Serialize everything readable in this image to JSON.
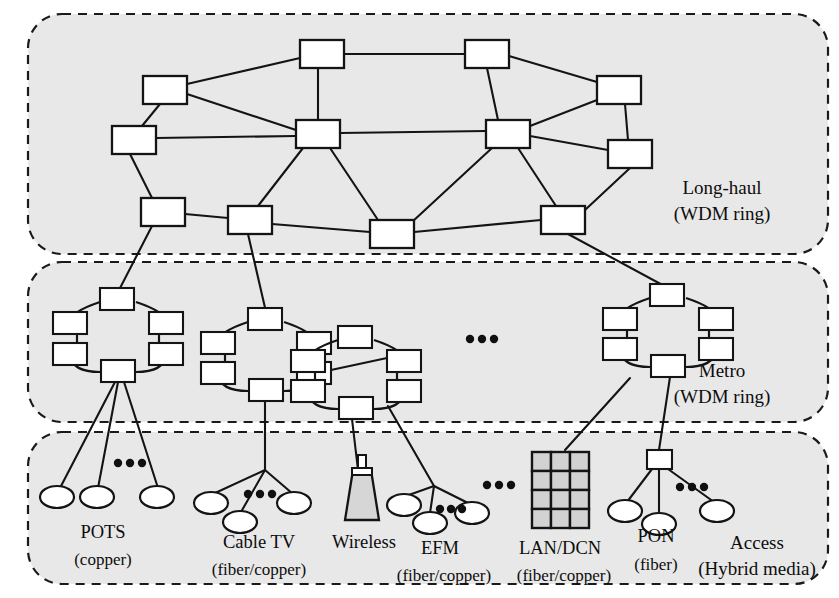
{
  "figure": {
    "background_color": "#ffffff",
    "zone_fill_color": "#e8e8e8",
    "line_color": "#141414",
    "node_fill_color": "#ffffff",
    "shaded_fill_color": "#d2d2d2"
  },
  "zones": [
    {
      "id": "long-haul",
      "label_line1": "Long-haul",
      "label_line2": "(WDM ring)",
      "label_x": 722,
      "label_y": 190,
      "rect": {
        "x": 28,
        "y": 14,
        "width": 800,
        "height": 240,
        "radius": 34
      },
      "node_count": 12
    },
    {
      "id": "metro",
      "label_line1": "Metro",
      "label_line2": "(WDM ring)",
      "label_x": 722,
      "label_y": 373,
      "rect": {
        "x": 28,
        "y": 262,
        "width": 800,
        "height": 160,
        "radius": 34
      },
      "ring_count": 4
    },
    {
      "id": "access",
      "label_line1": "Access",
      "label_line2": "(Hybrid media)",
      "label_x": 757,
      "label_y": 545,
      "rect": {
        "x": 28,
        "y": 432,
        "width": 800,
        "height": 152,
        "radius": 34
      },
      "branch_count": 6
    }
  ],
  "long_haul_nodes": [
    {
      "id": "lh1",
      "x": 300,
      "y": 40,
      "w": 44,
      "h": 28
    },
    {
      "id": "lh2",
      "x": 465,
      "y": 40,
      "w": 44,
      "h": 28
    },
    {
      "id": "lh3",
      "x": 143,
      "y": 76,
      "w": 44,
      "h": 28
    },
    {
      "id": "lh4",
      "x": 597,
      "y": 76,
      "w": 44,
      "h": 28
    },
    {
      "id": "lh5",
      "x": 112,
      "y": 126,
      "w": 44,
      "h": 28
    },
    {
      "id": "lh6",
      "x": 296,
      "y": 120,
      "w": 44,
      "h": 28
    },
    {
      "id": "lh7",
      "x": 486,
      "y": 120,
      "w": 44,
      "h": 28
    },
    {
      "id": "lh8",
      "x": 608,
      "y": 140,
      "w": 44,
      "h": 28
    },
    {
      "id": "lh9",
      "x": 141,
      "y": 198,
      "w": 44,
      "h": 28
    },
    {
      "id": "lh10",
      "x": 228,
      "y": 206,
      "w": 44,
      "h": 28
    },
    {
      "id": "lh11",
      "x": 370,
      "y": 220,
      "w": 44,
      "h": 28
    },
    {
      "id": "lh12",
      "x": 541,
      "y": 206,
      "w": 44,
      "h": 28
    }
  ],
  "long_haul_links": [
    [
      "lh1",
      "lh2"
    ],
    [
      "lh1",
      "lh3"
    ],
    [
      "lh1",
      "lh6"
    ],
    [
      "lh2",
      "lh4"
    ],
    [
      "lh2",
      "lh7"
    ],
    [
      "lh3",
      "lh5"
    ],
    [
      "lh3",
      "lh6"
    ],
    [
      "lh4",
      "lh7"
    ],
    [
      "lh4",
      "lh8"
    ],
    [
      "lh5",
      "lh6"
    ],
    [
      "lh5",
      "lh9"
    ],
    [
      "lh6",
      "lh7"
    ],
    [
      "lh6",
      "lh10"
    ],
    [
      "lh6",
      "lh11"
    ],
    [
      "lh7",
      "lh8"
    ],
    [
      "lh7",
      "lh11"
    ],
    [
      "lh7",
      "lh12"
    ],
    [
      "lh8",
      "lh12"
    ],
    [
      "lh9",
      "lh10"
    ],
    [
      "lh10",
      "lh11"
    ],
    [
      "lh11",
      "lh12"
    ]
  ],
  "metro_rings": [
    {
      "id": "ring1",
      "cx": 116,
      "cy": 333,
      "rx": 46,
      "ry": 42,
      "nodes": 6,
      "uplink_from": "lh9",
      "downlink_node": "bottom"
    },
    {
      "id": "ring2",
      "cx": 264,
      "cy": 352,
      "rx": 46,
      "ry": 42,
      "nodes": 6,
      "uplink_from": "lh10",
      "downlink_node": "bottom"
    },
    {
      "id": "ring3",
      "cx": 355,
      "cy": 372,
      "rx": 46,
      "ry": 42,
      "nodes": 6,
      "uplink_from": "ring2",
      "downlink_node": "bottom"
    },
    {
      "id": "ring4",
      "cx": 666,
      "cy": 328,
      "rx": 46,
      "ry": 42,
      "nodes": 6,
      "uplink_from": "lh12",
      "downlink_node": "bottom"
    }
  ],
  "metro_ellipsis": {
    "x": 478,
    "y": 339,
    "dots": 3
  },
  "access_branches": [
    {
      "id": "pots",
      "label": "POTS",
      "sublabel": "(copper)",
      "label_x": 103,
      "label_y": 534,
      "sublabel_x": 103,
      "sublabel_y": 561,
      "media": "copper",
      "source": {
        "x": 118,
        "y": 368
      },
      "terminals": [
        {
          "type": "ellipse",
          "x": 57,
          "y": 497
        },
        {
          "type": "ellipse",
          "x": 97,
          "y": 497
        },
        {
          "type": "ellipse",
          "x": 157,
          "y": 497
        }
      ],
      "ellipsis": {
        "x": 126,
        "y": 463,
        "dots": 3
      }
    },
    {
      "id": "cable-tv",
      "label": "Cable TV",
      "sublabel": "(fiber/copper)",
      "label_x": 259,
      "label_y": 544,
      "sublabel_x": 259,
      "sublabel_y": 571,
      "media": "fiber/copper",
      "source": {
        "x": 265,
        "y": 392
      },
      "terminals": [
        {
          "type": "ellipse",
          "x": 211,
          "y": 503
        },
        {
          "type": "ellipse",
          "x": 240,
          "y": 522
        },
        {
          "type": "ellipse",
          "x": 294,
          "y": 503
        }
      ],
      "ellipsis": {
        "x": 256,
        "y": 494,
        "dots": 3
      }
    },
    {
      "id": "wireless",
      "label": "Wireless",
      "sublabel": "",
      "label_x": 364,
      "label_y": 544,
      "media": "wireless",
      "source": {
        "x": 352,
        "y": 411
      },
      "terminals": [
        {
          "type": "tower",
          "x": 362,
          "y": 505
        }
      ]
    },
    {
      "id": "efm",
      "label": "EFM",
      "sublabel": "(fiber/copper)",
      "label_x": 440,
      "label_y": 550,
      "sublabel_x": 444,
      "sublabel_y": 577,
      "media": "fiber/copper",
      "source": {
        "x": 390,
        "y": 398
      },
      "terminals": [
        {
          "type": "ellipse",
          "x": 404,
          "y": 505
        },
        {
          "type": "ellipse",
          "x": 430,
          "y": 523
        },
        {
          "type": "ellipse",
          "x": 472,
          "y": 513
        }
      ],
      "ellipsis": {
        "x": 448,
        "y": 509,
        "dots": 3
      }
    },
    {
      "id": "lan-dcn",
      "label": "LAN/DCN",
      "sublabel": "(fiber/copper)",
      "label_x": 560,
      "label_y": 550,
      "sublabel_x": 564,
      "sublabel_y": 577,
      "media": "fiber/copper",
      "source": {
        "x": 633,
        "y": 368
      },
      "terminals": [
        {
          "type": "grid",
          "x": 532,
          "y": 452,
          "cols": 3,
          "rows": 4,
          "cell": 19
        }
      ],
      "ellipsis": {
        "x": 495,
        "y": 485,
        "dots": 3
      }
    },
    {
      "id": "pon",
      "label": "PON",
      "sublabel": "(fiber)",
      "label_x": 656,
      "label_y": 538,
      "sublabel_x": 656,
      "sublabel_y": 566,
      "media": "fiber",
      "source": {
        "x": 673,
        "y": 372
      },
      "splitter": {
        "x": 647,
        "y": 450,
        "w": 24,
        "h": 19
      },
      "terminals": [
        {
          "type": "ellipse",
          "x": 625,
          "y": 511
        },
        {
          "type": "ellipse",
          "x": 659,
          "y": 524
        },
        {
          "type": "ellipse",
          "x": 717,
          "y": 511
        }
      ],
      "ellipsis": {
        "x": 688,
        "y": 487,
        "dots": 3
      }
    }
  ]
}
